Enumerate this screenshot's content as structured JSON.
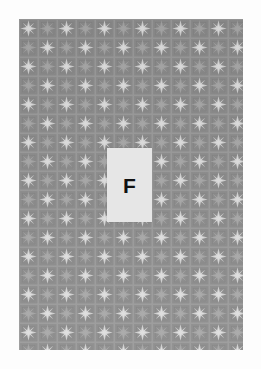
{
  "page": {
    "background_color": "#ffffff",
    "width": 261,
    "height": 369
  },
  "wallpaper": {
    "label": "star-grid-wallpaper-swatch",
    "background_color": "#8b8b8b",
    "grid_line_color": "#9a9a9a",
    "star_color": "#c9c9c9",
    "cell_size_px": 19,
    "star_points": 8,
    "columns": 12,
    "rows": 18,
    "x": 19,
    "y": 19,
    "width": 224,
    "height": 331
  },
  "card": {
    "label": "F",
    "background_color": "#e6e6e6",
    "text_color": "#111111",
    "x": 107,
    "y": 148,
    "width": 45,
    "height": 74
  }
}
